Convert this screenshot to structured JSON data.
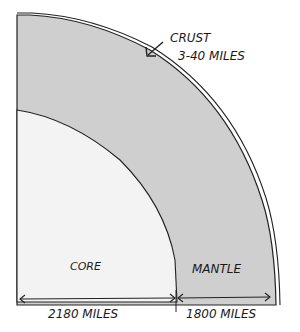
{
  "diagram": {
    "type": "earth-cross-section-quadrant",
    "layers": {
      "crust": {
        "label": "CRUST",
        "thickness": "3-40 MILES"
      },
      "mantle": {
        "label": "MANTLE",
        "thickness": "1800 MILES"
      },
      "core": {
        "label": "CORE",
        "radius": "2180 MILES"
      }
    },
    "colors": {
      "mantle_fill": "#cfcfcf",
      "core_fill": "#f3f3f3",
      "outline": "#222222",
      "background": "#ffffff"
    }
  }
}
